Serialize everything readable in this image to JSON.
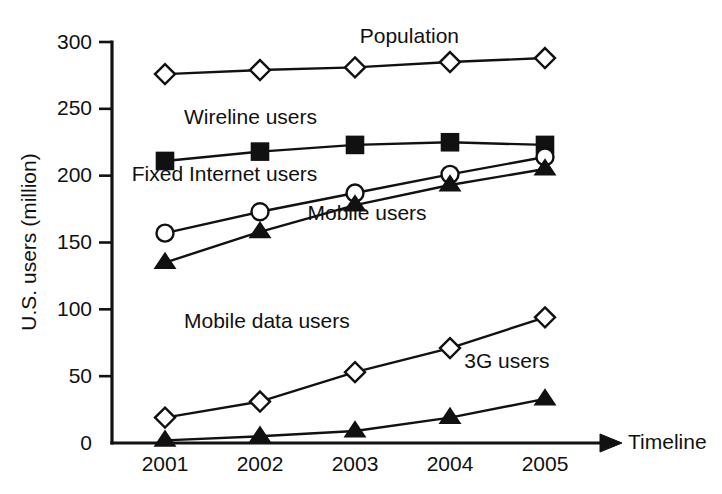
{
  "chart_data": {
    "type": "line",
    "title": "",
    "xlabel": "Timeline",
    "ylabel": "U.S. users (million)",
    "xlim": [
      2000.5,
      2005.5
    ],
    "ylim": [
      0,
      300
    ],
    "grid": false,
    "legend_position": "inline-annotations",
    "categories": [
      "2001",
      "2002",
      "2003",
      "2004",
      "2005"
    ],
    "x": [
      2001,
      2002,
      2003,
      2004,
      2005
    ],
    "yticks": [
      0,
      50,
      100,
      150,
      200,
      250,
      300
    ],
    "series": [
      {
        "name": "Population",
        "marker": "open-diamond",
        "values": [
          276,
          279,
          281,
          285,
          288
        ]
      },
      {
        "name": "Wireline users",
        "marker": "solid-square",
        "values": [
          211,
          218,
          223,
          225,
          223
        ]
      },
      {
        "name": "Fixed Internet users",
        "marker": "open-circle",
        "values": [
          157,
          173,
          187,
          201,
          214
        ]
      },
      {
        "name": "Mobile users",
        "marker": "solid-triangle",
        "values": [
          135,
          158,
          178,
          193,
          205
        ]
      },
      {
        "name": "Mobile data users",
        "marker": "open-diamond",
        "values": [
          19,
          31,
          53,
          71,
          94
        ]
      },
      {
        "name": "3G users",
        "marker": "solid-triangle",
        "values": [
          2,
          5,
          9,
          19,
          33
        ]
      }
    ],
    "annotations": [
      {
        "text": "Population",
        "x": 2003.05,
        "y": 299
      },
      {
        "text": "Wireline users",
        "x": 2001.2,
        "y": 239
      },
      {
        "text": "Fixed Internet users",
        "x": 2000.65,
        "y": 196
      },
      {
        "text": "Mobile users",
        "x": 2002.5,
        "y": 167
      },
      {
        "text": "Mobile data users",
        "x": 2001.2,
        "y": 86
      },
      {
        "text": "3G users",
        "x": 2004.15,
        "y": 56
      }
    ],
    "colors": {
      "line": "#111111",
      "marker_fill_open": "#ffffff",
      "marker_fill_solid": "#111111",
      "axis": "#111111",
      "background": "#ffffff"
    }
  }
}
